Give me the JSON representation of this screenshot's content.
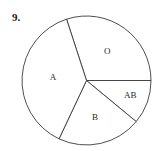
{
  "problem": {
    "number_label": "9."
  },
  "chart_data": {
    "type": "pie",
    "title": "",
    "categories": [
      "O",
      "AB",
      "B",
      "A"
    ],
    "values": [
      30,
      11,
      21,
      38
    ],
    "unit": "percent (estimated from slice angles)",
    "start_angle_deg": 108,
    "direction": "clockwise",
    "legend": "none",
    "labels_inside_slices": true
  }
}
